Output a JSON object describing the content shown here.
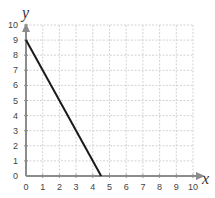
{
  "chart_data": {
    "type": "line",
    "title": "",
    "xlabel": "x",
    "ylabel": "y",
    "xlim": [
      0,
      10
    ],
    "ylim": [
      0,
      10
    ],
    "x_ticks": [
      0,
      1,
      2,
      3,
      4,
      5,
      6,
      7,
      8,
      9,
      10
    ],
    "y_ticks": [
      0,
      1,
      2,
      3,
      4,
      5,
      6,
      7,
      8,
      9,
      10
    ],
    "grid": true,
    "series": [
      {
        "name": "line",
        "x": [
          0,
          4.5
        ],
        "y": [
          9,
          0
        ],
        "color": "#1a1a1a"
      }
    ],
    "axis_color": "#8c8c8c",
    "grid_color": "#c8c8c8"
  }
}
